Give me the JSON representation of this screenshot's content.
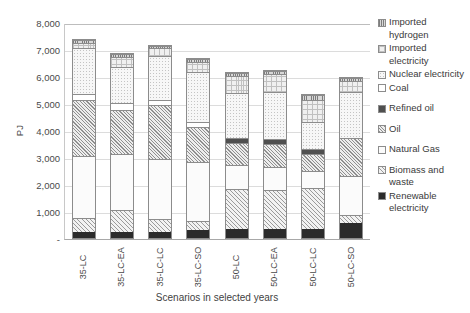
{
  "chart_data": {
    "type": "bar",
    "stacked": true,
    "title": "",
    "xlabel": "Scenarios in selected years",
    "ylabel": "PJ",
    "ylim": [
      0,
      8000
    ],
    "ytick_labels": [
      "8,000",
      "7,000",
      "6,000",
      "5,000",
      "4,000",
      "3,000",
      "2,000",
      "1,000",
      "-"
    ],
    "ytick_values": [
      8000,
      7000,
      6000,
      5000,
      4000,
      3000,
      2000,
      1000,
      0
    ],
    "grid": true,
    "legend_position": "right",
    "categories": [
      "35-LC",
      "35-LC-EA",
      "35-LC-LC",
      "35-LC-SO",
      "50-LC",
      "50-LC-EA",
      "50-LC-LC",
      "50-LC-SO"
    ],
    "series": [
      {
        "name": "Renewable electricity",
        "fill": "fill-renewable",
        "values": [
          220,
          220,
          240,
          300,
          330,
          330,
          340,
          560
        ]
      },
      {
        "name": "Biomass and waste",
        "fill": "fill-biomass",
        "values": [
          530,
          840,
          460,
          330,
          1500,
          1480,
          1530,
          300
        ]
      },
      {
        "name": "Natural Gas",
        "fill": "fill-natgas",
        "values": [
          2330,
          2070,
          2250,
          2230,
          900,
          870,
          650,
          1480
        ]
      },
      {
        "name": "Oil",
        "fill": "fill-oil",
        "values": [
          2080,
          1650,
          2030,
          1290,
          830,
          850,
          630,
          1400
        ]
      },
      {
        "name": "Refined oil",
        "fill": "fill-refined-oil",
        "values": [
          0,
          0,
          0,
          0,
          190,
          190,
          200,
          0
        ]
      },
      {
        "name": "Coal",
        "fill": "fill-coal",
        "values": [
          240,
          260,
          170,
          200,
          0,
          0,
          0,
          0
        ]
      },
      {
        "name": "Nuclear electricity",
        "fill": "fill-nuclear",
        "values": [
          1700,
          1350,
          1650,
          1850,
          1700,
          1750,
          1000,
          1750
        ]
      },
      {
        "name": "Imported electricity",
        "fill": "fill-imp-elec",
        "values": [
          200,
          400,
          300,
          400,
          640,
          670,
          830,
          400
        ]
      },
      {
        "name": "Imported hydrogen",
        "fill": "fill-imp-hydrogen",
        "values": [
          100,
          100,
          100,
          100,
          110,
          110,
          200,
          110
        ]
      }
    ]
  },
  "legend": {
    "items": [
      {
        "label": "Imported hydrogen",
        "fill": "fill-imp-hydrogen",
        "spaced": false
      },
      {
        "label": "Imported electricity",
        "fill": "fill-imp-elec",
        "spaced": false
      },
      {
        "label": "Nuclear electricity",
        "fill": "fill-nuclear",
        "spaced": false
      },
      {
        "label": "Coal",
        "fill": "fill-coal",
        "spaced": false
      },
      {
        "label": "Refined oil",
        "fill": "fill-refined-oil",
        "spaced": true
      },
      {
        "label": "Oil",
        "fill": "fill-oil",
        "spaced": true
      },
      {
        "label": "Natural Gas",
        "fill": "fill-natgas",
        "spaced": true
      },
      {
        "label": "Biomass and waste",
        "fill": "fill-biomass",
        "spaced": true
      },
      {
        "label": "Renewable electricity",
        "fill": "fill-renewable",
        "spaced": false
      }
    ]
  }
}
